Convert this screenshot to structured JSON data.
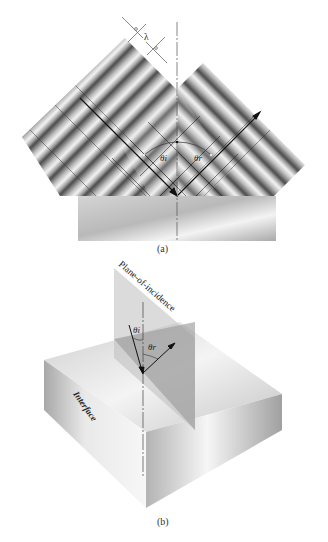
{
  "figure": {
    "part_a": {
      "caption": "(a)",
      "labels": {
        "wavelength": "λ",
        "incident_angle": "θi",
        "reflected_angle": "θr"
      },
      "elements": [
        "incident-wave-band",
        "reflected-wave-band",
        "interference-region",
        "reflecting-medium-block",
        "surface-normal-line",
        "incident-ray",
        "reflected-ray"
      ]
    },
    "part_b": {
      "caption": "(b)",
      "labels": {
        "plane": "Plane-of-incidence",
        "interface": "Interface",
        "incident_angle": "θi",
        "reflected_angle": "θr"
      },
      "elements": [
        "plane-of-incidence",
        "interface-block",
        "surface-normal-line",
        "incident-ray",
        "reflected-ray"
      ]
    },
    "colors": {
      "background": "#ffffff",
      "wave_dark": "#555555",
      "wave_light": "#f0f0f0",
      "line": "#222222",
      "block_light": "#f2f2f2",
      "block_mid": "#bdbdbd",
      "plane": "#a9a9a9"
    }
  }
}
